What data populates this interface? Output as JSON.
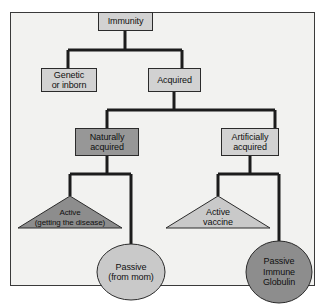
{
  "figure": {
    "type": "hierarchy-tree",
    "root": "Immunity",
    "frame": {
      "border_color": "#3a3a3a",
      "background": "#f2f2f0"
    },
    "colors": {
      "box_light": "#d2d2d2",
      "box_dark": "#979797",
      "shape_light": "#c9c9c9",
      "shape_dark": "#8d8d8d",
      "connector": "#1c1c1c",
      "outline": "#2b2b2b",
      "text": "#101010"
    }
  },
  "nodes": {
    "immunity": {
      "label": "Immunity",
      "shape": "rectangle",
      "fill": "light",
      "level": 1
    },
    "genetic": {
      "label_lines": [
        "Genetic",
        "or inborn"
      ],
      "shape": "rectangle",
      "fill": "light",
      "level": 2
    },
    "acquired": {
      "label": "Acquired",
      "shape": "rectangle",
      "fill": "light",
      "level": 2
    },
    "naturally_acquired": {
      "label_lines": [
        "Naturally",
        "acquired"
      ],
      "shape": "rectangle",
      "fill": "dark",
      "level": 3
    },
    "artificially_acquired": {
      "label_lines": [
        "Artificially",
        "acquired"
      ],
      "shape": "rectangle",
      "fill": "light",
      "level": 3
    },
    "active_disease": {
      "label_lines": [
        "Active",
        "(getting the disease)"
      ],
      "shape": "triangle",
      "fill": "dark",
      "level": 4
    },
    "active_vaccine": {
      "label_lines": [
        "Active",
        "vaccine"
      ],
      "shape": "triangle",
      "fill": "light",
      "level": 4
    },
    "passive_mom": {
      "label_lines": [
        "Passive",
        "(from mom)"
      ],
      "shape": "ellipse",
      "fill": "light",
      "level": 4
    },
    "passive_globulin": {
      "label_lines": [
        "Passive",
        "Immune",
        "Globulin"
      ],
      "shape": "ellipse",
      "fill": "dark",
      "level": 4
    }
  },
  "edges": [
    {
      "from": "immunity",
      "to": "genetic"
    },
    {
      "from": "immunity",
      "to": "acquired"
    },
    {
      "from": "acquired",
      "to": "naturally_acquired"
    },
    {
      "from": "acquired",
      "to": "artificially_acquired"
    },
    {
      "from": "naturally_acquired",
      "to": "active_disease"
    },
    {
      "from": "naturally_acquired",
      "to": "passive_mom"
    },
    {
      "from": "artificially_acquired",
      "to": "active_vaccine"
    },
    {
      "from": "artificially_acquired",
      "to": "passive_globulin"
    }
  ]
}
